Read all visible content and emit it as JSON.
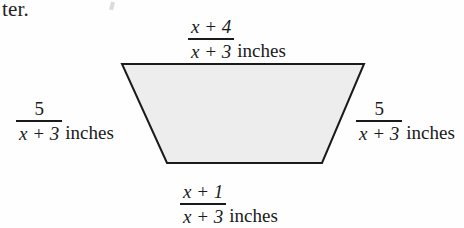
{
  "page": {
    "cropped_text_fragment": "ter.",
    "background_color": "#fefefe",
    "ink_color": "#1a1a1a",
    "figure_fill_color": "#ededed",
    "bleed_through_text": "6 3 0 1"
  },
  "figure": {
    "shape": "trapezoid",
    "fill": "#ededed",
    "stroke": "#1a1a1a",
    "stroke_width": 2,
    "vertices": {
      "top_left": [
        122,
        64
      ],
      "top_right": [
        364,
        64
      ],
      "bottom_right": [
        322,
        163
      ],
      "bottom_left": [
        167,
        163
      ]
    }
  },
  "labels": {
    "top": {
      "numerator": "x + 4",
      "denominator": "x + 3",
      "unit": "inches",
      "side": "top-base"
    },
    "bottom": {
      "numerator": "x + 1",
      "denominator": "x + 3",
      "unit": "inches",
      "side": "bottom-base"
    },
    "left": {
      "numerator": "5",
      "denominator": "x + 3",
      "unit": "inches",
      "side": "left-leg"
    },
    "right": {
      "numerator": "5",
      "denominator": "x + 3",
      "unit": "inches",
      "side": "right-leg"
    }
  }
}
